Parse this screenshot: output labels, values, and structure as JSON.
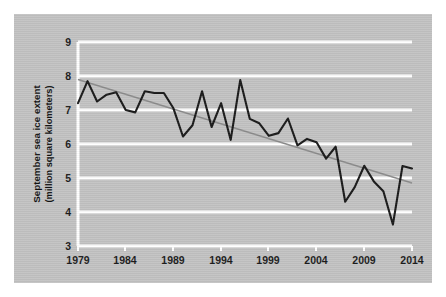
{
  "chart_data": {
    "type": "line",
    "title": "",
    "subtitle": "",
    "xlabel": "",
    "ylabel": "September sea ice extent",
    "ylabel_units": "(million square kilometers)",
    "xlim": [
      1979,
      2014
    ],
    "ylim": [
      3,
      9
    ],
    "xticks": [
      1979,
      1984,
      1989,
      1994,
      1999,
      2004,
      2009,
      2014
    ],
    "yticks": [
      3,
      4,
      5,
      6,
      7,
      8,
      9
    ],
    "grid": "horizontal-white",
    "legend": "none",
    "x": [
      1979,
      1980,
      1981,
      1982,
      1983,
      1984,
      1985,
      1986,
      1987,
      1988,
      1989,
      1990,
      1991,
      1992,
      1993,
      1994,
      1995,
      1996,
      1997,
      1998,
      1999,
      2000,
      2001,
      2002,
      2003,
      2004,
      2005,
      2006,
      2007,
      2008,
      2009,
      2010,
      2011,
      2012,
      2013,
      2014
    ],
    "series": [
      {
        "name": "September sea ice extent",
        "color": "#1a1a1a",
        "values": [
          7.2,
          7.85,
          7.25,
          7.45,
          7.52,
          7.0,
          6.93,
          7.55,
          7.5,
          7.5,
          7.05,
          6.22,
          6.55,
          7.55,
          6.5,
          7.2,
          6.12,
          7.88,
          6.74,
          6.61,
          6.24,
          6.32,
          6.75,
          5.96,
          6.15,
          6.05,
          5.57,
          5.92,
          4.3,
          4.73,
          5.36,
          4.9,
          4.61,
          3.63,
          5.35,
          5.28
        ]
      },
      {
        "name": "linear trend",
        "color": "#8c8c8c",
        "type": "trendline",
        "start_value": 7.9,
        "end_value": 4.85
      }
    ],
    "xtick_labels": [
      "1979",
      "1984",
      "1989",
      "1994",
      "1999",
      "2004",
      "2009",
      "2014"
    ],
    "ytick_labels": [
      "3",
      "4",
      "5",
      "6",
      "7",
      "8",
      "9"
    ],
    "colors": {
      "panel_background": "#c3c3c3",
      "figure_background": "#ffffff",
      "gridline": "#ffffff",
      "data_line": "#1a1a1a",
      "trend_line": "#8c8c8c",
      "text": "#121212"
    }
  }
}
